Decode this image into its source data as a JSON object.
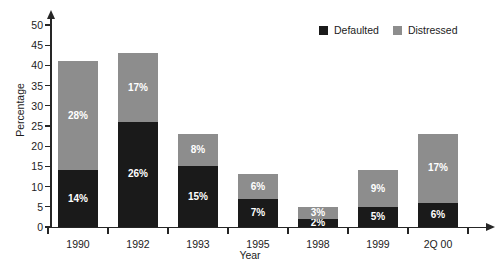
{
  "chart_data": {
    "type": "bar",
    "subtype": "stacked-bar",
    "title": "",
    "xlabel": "Year",
    "ylabel": "Percentage",
    "ylim": [
      0,
      50
    ],
    "ytick_step": 5,
    "yticks": [
      "0",
      "5",
      "10",
      "15",
      "20",
      "25",
      "30",
      "35",
      "40",
      "45",
      "50"
    ],
    "grid": false,
    "legend_position": "top-right",
    "categories": [
      "1990",
      "1992",
      "1993",
      "1995",
      "1998",
      "1999",
      "2Q 00"
    ],
    "series": [
      {
        "name": "Defaulted",
        "color": "#1a1a1a",
        "values": [
          14,
          26,
          15,
          7,
          2,
          5,
          6
        ],
        "labels": [
          "14%",
          "26%",
          "15%",
          "7%",
          "2%",
          "5%",
          "6%"
        ]
      },
      {
        "name": "Distressed",
        "color": "#8d8d8d",
        "values": [
          27,
          17,
          8,
          6,
          3,
          9,
          17
        ],
        "labels": [
          "28%",
          "17%",
          "8%",
          "6%",
          "3%",
          "9%",
          "17%"
        ]
      }
    ],
    "totals": [
      41,
      43,
      23,
      13,
      5,
      14,
      23
    ]
  },
  "legend": {
    "items": [
      {
        "label": "Defaulted",
        "swatch": "defaulted"
      },
      {
        "label": "Distressed",
        "swatch": "distressed"
      }
    ]
  }
}
